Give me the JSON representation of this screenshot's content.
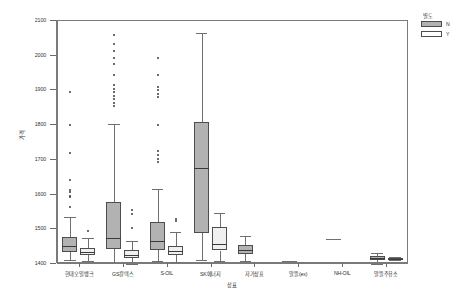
{
  "chart_data": {
    "type": "box",
    "title": "",
    "xlabel": "상표",
    "ylabel": "가격",
    "ylim": [
      1400,
      2100
    ],
    "yticks": [
      1400,
      1500,
      1600,
      1700,
      1800,
      1900,
      2000,
      2100
    ],
    "ytick_labels": [
      "1400",
      "1500",
      "1600",
      "1700",
      "1800",
      "1900",
      "2000",
      "2100"
    ],
    "grid": false,
    "legend": {
      "title": "별도",
      "position": "top-right",
      "entries": [
        {
          "label": "N",
          "color": "#b2b2b2"
        },
        {
          "label": "Y",
          "color": "#ffffff"
        }
      ]
    },
    "categories": [
      "현대오일뱅크",
      "GS칼텍스",
      "S-OIL",
      "SK에너지",
      "자가상표",
      "알뜰(ex)",
      "NH-OIL",
      "알뜰주유소"
    ],
    "series": [
      {
        "name": "N",
        "color": "#b2b2b2",
        "boxes": [
          {
            "category": "현대오일뱅크",
            "min": 1408,
            "q1": 1432,
            "median": 1448,
            "q3": 1475,
            "max": 1533,
            "outliers": [
              1560,
              1589,
              1592,
              1605,
              1610,
              1640,
              1718,
              1797,
              1893
            ]
          },
          {
            "category": "GS칼텍스",
            "min": 1401,
            "q1": 1440,
            "median": 1472,
            "q3": 1577,
            "max": 1800,
            "outliers": [
              1852,
              1862,
              1872,
              1882,
              1892,
              1901,
              1912,
              1942,
              1972,
              1990,
              2010,
              2032,
              2058
            ]
          },
          {
            "category": "S-OIL",
            "min": 1405,
            "q1": 1438,
            "median": 1464,
            "q3": 1518,
            "max": 1612,
            "outliers": [
              1690,
              1700,
              1710,
              1722,
              1798,
              1878,
              1888,
              1898,
              1908,
              1943,
              1990
            ]
          },
          {
            "category": "SK에너지",
            "min": 1408,
            "q1": 1487,
            "median": 1674,
            "q3": 1807,
            "max": 2062,
            "outliers": []
          },
          {
            "category": "자가상표",
            "min": 1405,
            "q1": 1425,
            "median": 1437,
            "q3": 1452,
            "max": 1478,
            "outliers": []
          },
          {
            "category": "알뜰(ex)",
            "min": 1406,
            "q1": 1406,
            "median": 1406,
            "q3": 1406,
            "max": 1406,
            "outliers": []
          },
          {
            "category": "NH-OIL",
            "min": 1468,
            "q1": 1468,
            "median": 1468,
            "q3": 1468,
            "max": 1468,
            "outliers": []
          },
          {
            "category": "알뜰주유소",
            "min": 1398,
            "q1": 1410,
            "median": 1414,
            "q3": 1421,
            "max": 1430,
            "outliers": []
          }
        ]
      },
      {
        "name": "Y",
        "color": "#f0f0f0",
        "boxes": [
          {
            "category": "현대오일뱅크",
            "min": 1405,
            "q1": 1424,
            "median": 1433,
            "q3": 1443,
            "max": 1472,
            "outliers": [
              1492
            ]
          },
          {
            "category": "GS칼텍스",
            "min": 1398,
            "q1": 1413,
            "median": 1424,
            "q3": 1437,
            "max": 1462,
            "outliers": [
              1502,
              1541,
              1552
            ]
          },
          {
            "category": "S-OIL",
            "min": 1403,
            "q1": 1424,
            "median": 1436,
            "q3": 1450,
            "max": 1488,
            "outliers": [
              1520,
              1527
            ]
          },
          {
            "category": "SK에너지",
            "min": 1406,
            "q1": 1436,
            "median": 1456,
            "q3": 1505,
            "max": 1545,
            "outliers": []
          },
          {
            "category": "자가상표",
            "min": null,
            "q1": null,
            "median": null,
            "q3": null,
            "max": null,
            "outliers": []
          },
          {
            "category": "알뜰(ex)",
            "min": null,
            "q1": null,
            "median": null,
            "q3": null,
            "max": null,
            "outliers": []
          },
          {
            "category": "NH-OIL",
            "min": null,
            "q1": null,
            "median": null,
            "q3": null,
            "max": null,
            "outliers": []
          },
          {
            "category": "알뜰주유소",
            "min": 1409,
            "q1": 1409,
            "median": 1412,
            "q3": 1415,
            "max": 1418,
            "outliers": []
          }
        ]
      }
    ]
  }
}
